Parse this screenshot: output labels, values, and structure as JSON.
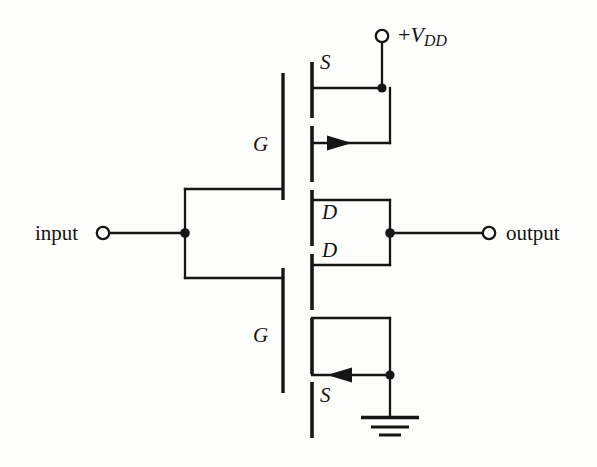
{
  "figure": {
    "kind": "circuit-schematic",
    "name": "CMOS inverter",
    "background_color": "#fdfdfb",
    "ink_color": "#161616"
  },
  "terminals": {
    "input": {
      "label": "input",
      "x": 103,
      "y": 233
    },
    "output": {
      "label": "output",
      "x": 489,
      "y": 233
    },
    "supply": {
      "label_plus": "+",
      "label_v": "V",
      "label_sub": "DD",
      "x": 382,
      "y": 35
    }
  },
  "transistors": [
    {
      "id": "pmos-top",
      "type": "p-channel MOSFET",
      "pins": {
        "source": "S",
        "gate": "G",
        "drain": "D"
      },
      "source_label": "S",
      "gate_label": "G",
      "drain_label": "D",
      "arrow_direction": "right"
    },
    {
      "id": "nmos-bottom",
      "type": "n-channel MOSFET",
      "pins": {
        "drain": "D",
        "gate": "G",
        "source": "S"
      },
      "drain_label": "D",
      "gate_label": "G",
      "source_label": "S",
      "arrow_direction": "left"
    }
  ],
  "labels": {
    "s_top": "S",
    "g_top": "G",
    "d_top": "D",
    "d_bottom": "D",
    "g_bottom": "G",
    "s_bottom": "S"
  },
  "ground": {
    "name": "earth-ground",
    "bars": 3
  }
}
